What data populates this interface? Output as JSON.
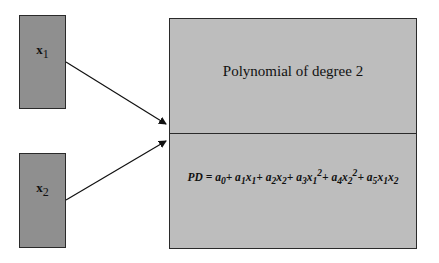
{
  "inputs": [
    {
      "label": "x",
      "subscript": "1"
    },
    {
      "label": "x",
      "subscript": "2"
    }
  ],
  "node": {
    "title": "Polynomial of degree 2",
    "formula": "PD = a0 + a1x1 + a2x2 + a3x1^2 + a4x2^2 + a5x1x2"
  },
  "colors": {
    "input_fill": "#8f8f8f",
    "node_fill": "#bdbdbd",
    "stroke": "#2a2a2a"
  }
}
